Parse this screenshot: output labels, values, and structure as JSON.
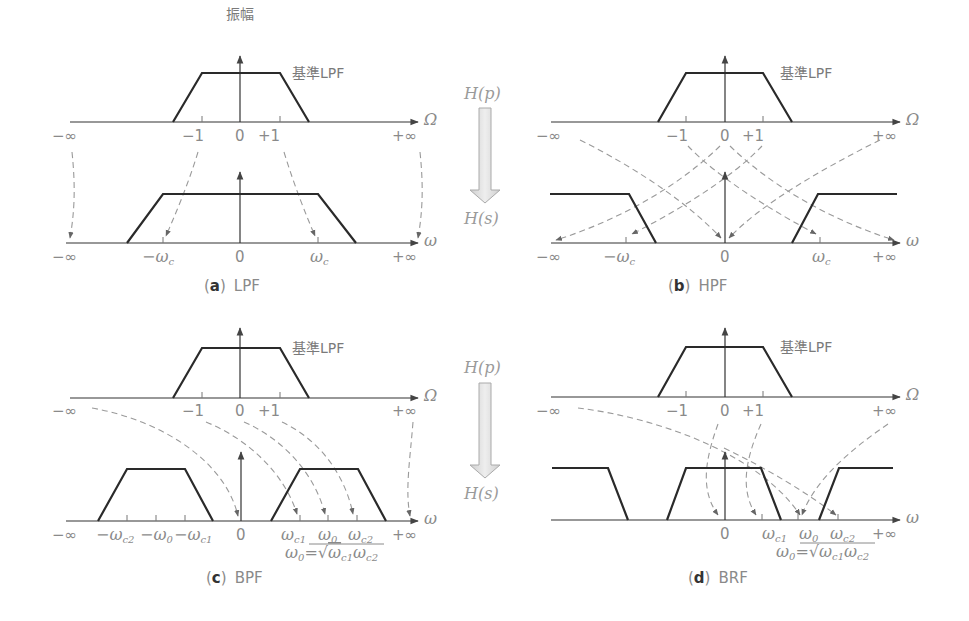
{
  "figure": {
    "y_axis_label": "振幅",
    "reference_filter_label": "基準LPF",
    "transform": {
      "from": "H(p)",
      "to": "H(s)"
    },
    "colors": {
      "curve": "#2a2a2a",
      "axis": "#333333",
      "label": "#8a8a8a",
      "dashed_mapping": "#9a9a9a",
      "transform_arrow_fill": "#dedede"
    }
  },
  "panels": [
    {
      "id": "a",
      "caption_letter": "a",
      "caption_text": "LPF",
      "top_axis": {
        "variable": "Ω",
        "ticks": [
          "−∞",
          "−1",
          "0",
          "+1",
          "+∞"
        ]
      },
      "bottom_axis": {
        "variable": "ω",
        "ticks": [
          "−∞",
          "−ωc",
          "0",
          "ωc",
          "+∞"
        ]
      }
    },
    {
      "id": "b",
      "caption_letter": "b",
      "caption_text": "HPF",
      "top_axis": {
        "variable": "Ω",
        "ticks": [
          "−∞",
          "−1",
          "0",
          "+1",
          "+∞"
        ]
      },
      "bottom_axis": {
        "variable": "ω",
        "ticks": [
          "−∞",
          "−ωc",
          "0",
          "ωc",
          "+∞"
        ]
      }
    },
    {
      "id": "c",
      "caption_letter": "c",
      "caption_text": "BPF",
      "top_axis": {
        "variable": "Ω",
        "ticks": [
          "−∞",
          "−1",
          "0",
          "+1",
          "+∞"
        ]
      },
      "bottom_axis": {
        "variable": "ω",
        "ticks": [
          "−∞",
          "−ωc2",
          "−ω0",
          "−ωc1",
          "0",
          "ωc1",
          "ω0",
          "ωc2",
          "+∞"
        ]
      },
      "formula": "ω0 = √(ωc1 ωc2)"
    },
    {
      "id": "d",
      "caption_letter": "d",
      "caption_text": "BRF",
      "top_axis": {
        "variable": "Ω",
        "ticks": [
          "−∞",
          "−1",
          "0",
          "+1",
          "+∞"
        ]
      },
      "bottom_axis": {
        "variable": "ω",
        "ticks": [
          "0",
          "ωc1",
          "ω0",
          "ωc2",
          "+∞"
        ]
      },
      "formula": "ω0 = √(ωc1 ωc2)"
    }
  ],
  "text": {
    "minf": "−∞",
    "pinf": "+∞",
    "m1": "−1",
    "zero": "0",
    "p1": "+1",
    "Omega": "Ω",
    "omega": "ω",
    "w": "ω",
    "minus_w": "−ω",
    "c": "c",
    "c1": "c1",
    "c2": "c2",
    "zero_sub": "0",
    "eq": "=",
    "sqrt": "√",
    "paren_open": "(",
    "paren_close": ")",
    "a": "a",
    "b": "b",
    "c_letter": "c",
    "d": "d",
    "LPF": "LPF",
    "HPF": "HPF",
    "BPF": "BPF",
    "BRF": "BRF",
    "amp": "振幅",
    "ref": "基準LPF",
    "Hp": "H(p)",
    "Hs": "H(s)"
  }
}
